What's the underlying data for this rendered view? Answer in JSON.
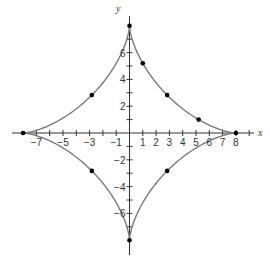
{
  "chart_data": {
    "type": "line",
    "title": "",
    "xlabel": "x",
    "ylabel": "y",
    "xlim": [
      -8,
      8
    ],
    "ylim": [
      -8,
      8
    ],
    "grid": false,
    "legend": null,
    "curve": "astroid x^(2/3) + y^(2/3) = 4",
    "x_tick_labels": [
      "-7",
      "-5",
      "-3",
      "-1",
      "1",
      "2",
      "3",
      "4",
      "5",
      "6",
      "7",
      "8"
    ],
    "x_ticks": [
      -7,
      -6,
      -5,
      -4,
      -3,
      -2,
      -1,
      1,
      2,
      3,
      4,
      5,
      6,
      7,
      8,
      9
    ],
    "y_tick_labels": [
      "6",
      "4",
      "2",
      "-2",
      "-4",
      "-6"
    ],
    "y_ticks": [
      -7,
      -6,
      -5,
      -4,
      -3,
      -2,
      -1,
      1,
      2,
      3,
      4,
      5,
      6,
      7
    ],
    "series": [
      {
        "name": "astroid",
        "color": "#7a7a7a",
        "points": "parametric x=8cos^3(t), y=8sin^3(t), t in [0, 2pi]"
      },
      {
        "name": "marked points",
        "color": "#000000",
        "x": [
          8,
          0,
          -8,
          0,
          1,
          2.83,
          5.2,
          -2.83,
          -2.83,
          2.83
        ],
        "y": [
          0,
          8,
          0,
          -8,
          5.2,
          2.83,
          1,
          2.83,
          -2.83,
          -2.83
        ]
      }
    ]
  },
  "axes": {
    "x_name": "x",
    "y_name": "y",
    "axis_color": "#333333",
    "curve_color": "#7a7a7a",
    "point_color": "#000000"
  }
}
